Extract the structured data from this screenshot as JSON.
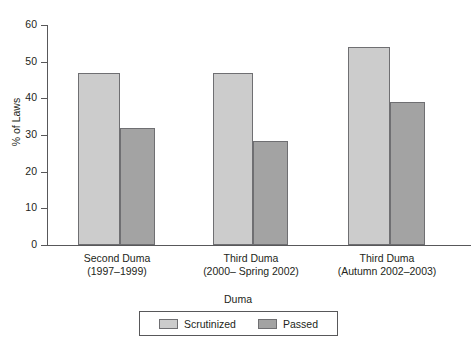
{
  "chart_data": {
    "type": "bar",
    "title": "",
    "subtitle": "",
    "xlabel": "Duma",
    "ylabel": "% of Laws",
    "ylim": [
      0,
      60
    ],
    "yticks": [
      0,
      10,
      20,
      30,
      40,
      50,
      60
    ],
    "ytick_labels": [
      "0",
      "10",
      "20",
      "30",
      "40",
      "50",
      "60"
    ],
    "grid": false,
    "legend_position": "bottom-center",
    "categories": [
      "Second Duma\n(1997–1999)",
      "Third Duma\n(2000– Spring 2002)",
      "Third Duma\n(Autumn 2002–2003)"
    ],
    "category_lines": [
      {
        "line1": "Second Duma",
        "line2": "(1997–1999)"
      },
      {
        "line1": "Third Duma",
        "line2": "(2000– Spring 2002)"
      },
      {
        "line1": "Third Duma",
        "line2": "(Autumn 2002–2003)"
      }
    ],
    "series": [
      {
        "name": "Scrutinized",
        "color": "#cccccc",
        "values": [
          47,
          47,
          54
        ]
      },
      {
        "name": "Passed",
        "color": "#a3a3a3",
        "values": [
          32,
          28.5,
          39
        ]
      }
    ],
    "annotations": []
  },
  "legend": {
    "items": [
      {
        "label": "Scrutinized",
        "swatch": "light-gray-swatch"
      },
      {
        "label": "Passed",
        "swatch": "dark-gray-swatch"
      }
    ]
  },
  "axes": {
    "y_title": "% of Laws",
    "x_title": "Duma"
  },
  "colors": {
    "series_light": "#cccccc",
    "series_dark": "#a3a3a3",
    "axis": "#58585a",
    "text": "#231f20",
    "background": "#ffffff"
  }
}
